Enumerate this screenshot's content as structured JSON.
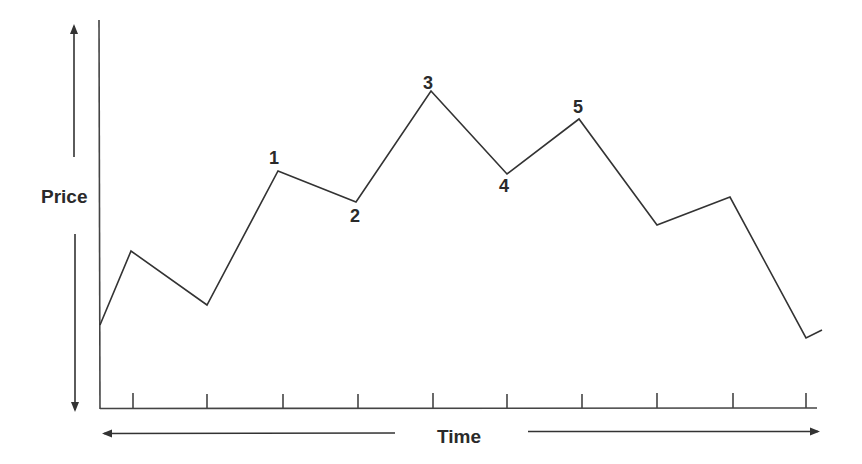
{
  "chart_data": {
    "type": "line",
    "title": "",
    "xlabel": "Time",
    "ylabel": "Price",
    "grid": false,
    "legend": null,
    "x_ticks": 10,
    "tick_x_px": [
      133,
      207,
      283,
      358,
      433,
      507,
      582,
      657,
      733,
      806
    ],
    "points_px": [
      [
        100,
        325
      ],
      [
        131,
        251
      ],
      [
        207,
        305
      ],
      [
        278,
        171
      ],
      [
        356,
        202
      ],
      [
        431,
        91
      ],
      [
        507,
        174
      ],
      [
        579,
        119
      ],
      [
        657,
        225
      ],
      [
        730,
        197
      ],
      [
        806,
        338
      ],
      [
        822,
        330
      ]
    ],
    "series": [
      {
        "name": "Price",
        "x": [
          0,
          0.4,
          1.4,
          2.3,
          3.3,
          4.3,
          5.3,
          6.3,
          7.3,
          8.3,
          9.3,
          9.5
        ],
        "values": [
          22,
          40,
          27,
          58,
          51,
          77,
          57,
          70,
          45,
          52,
          17,
          19
        ]
      }
    ],
    "annotations": [
      {
        "label": "1",
        "point_index": 3
      },
      {
        "label": "2",
        "point_index": 4
      },
      {
        "label": "3",
        "point_index": 5
      },
      {
        "label": "4",
        "point_index": 6
      },
      {
        "label": "5",
        "point_index": 7
      }
    ],
    "ylim": [
      0,
      100
    ],
    "xlim": [
      0,
      9.5
    ]
  },
  "labels": {
    "y_axis": "Price",
    "x_axis": "Time",
    "wave_1": "1",
    "wave_2": "2",
    "wave_3": "3",
    "wave_4": "4",
    "wave_5": "5"
  },
  "colors": {
    "line": "#333333",
    "text": "#2a2a2a",
    "background": "#ffffff"
  }
}
